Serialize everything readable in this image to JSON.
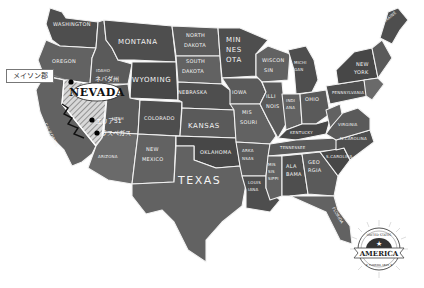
{
  "map": {
    "title": "United States of America",
    "style": "chalkboard",
    "highlight_state": "NEVADA",
    "highlight_state_jp": "ネバダ州",
    "colors": {
      "background": "#ffffff",
      "state_fill": "#5a5a5a",
      "state_border": "#f2f2f2",
      "label": "#f4f4f4",
      "nevada_fill": "#e8e8e8",
      "marker": "#000000"
    }
  },
  "states": [
    {
      "id": "WA",
      "label": "WASHINGTON"
    },
    {
      "id": "OR",
      "label": "OREGON"
    },
    {
      "id": "ID",
      "label": "IDAHO"
    },
    {
      "id": "MT",
      "label": "MONTANA"
    },
    {
      "id": "WY",
      "label": "WYOMING"
    },
    {
      "id": "CA",
      "label": "CALIFORNIA"
    },
    {
      "id": "NV",
      "label": "NEVADA"
    },
    {
      "id": "UT",
      "label": "UTAH"
    },
    {
      "id": "AZ",
      "label": "ARIZONA"
    },
    {
      "id": "CO",
      "label": "COLORADO"
    },
    {
      "id": "NM",
      "label": "NEW MEXICO"
    },
    {
      "id": "ND",
      "label": "NORTH DAKOTA"
    },
    {
      "id": "SD",
      "label": "SOUTH DAKOTA"
    },
    {
      "id": "NE",
      "label": "NEBRASKA"
    },
    {
      "id": "KS",
      "label": "KANSAS"
    },
    {
      "id": "OK",
      "label": "OKLAHOMA"
    },
    {
      "id": "TX",
      "label": "TEXAS"
    },
    {
      "id": "MN",
      "label": "MINNESOTA"
    },
    {
      "id": "IA",
      "label": "IOWA"
    },
    {
      "id": "MO",
      "label": "MISSOURI"
    },
    {
      "id": "AR",
      "label": "ARKANSAS"
    },
    {
      "id": "LA",
      "label": "LOUISIANA"
    },
    {
      "id": "WI",
      "label": "WISCONSIN"
    },
    {
      "id": "IL",
      "label": "ILLINOIS"
    },
    {
      "id": "MI",
      "label": "MICHIGAN"
    },
    {
      "id": "IN",
      "label": "INDIANA"
    },
    {
      "id": "OH",
      "label": "OHIO"
    },
    {
      "id": "KY",
      "label": "KENTUCKY"
    },
    {
      "id": "TN",
      "label": "TENNESSEE"
    },
    {
      "id": "MS",
      "label": "MISSISSIPPI"
    },
    {
      "id": "AL",
      "label": "ALABAMA"
    },
    {
      "id": "GA",
      "label": "GEORGIA"
    },
    {
      "id": "FL",
      "label": "FLORIDA"
    },
    {
      "id": "SC",
      "label": "SOUTH CAROLINA"
    },
    {
      "id": "NC",
      "label": "NORTH CAROLINA"
    },
    {
      "id": "VA",
      "label": "VIRGINIA"
    },
    {
      "id": "WV",
      "label": "WEST VIRGINIA"
    },
    {
      "id": "PA",
      "label": "PENNSYLVANIA"
    },
    {
      "id": "NY",
      "label": "NEW YORK"
    },
    {
      "id": "ME",
      "label": "MAINE"
    }
  ],
  "labels": {
    "WA": "WASHINGTON",
    "OR": "OREGON",
    "ID": "IDAHO",
    "MT": "MONTANA",
    "WY": "WYOMING",
    "CA": "CALIFORNIA",
    "NV": "NEVADA",
    "NV_jp": "ネバダ州",
    "UT": "UTAH",
    "AZ": "ARIZONA",
    "CO": "COLORADO",
    "NM1": "NEW",
    "NM2": "MEXICO",
    "ND1": "NORTH",
    "ND2": "DAKOTA",
    "SD1": "SOUTH",
    "SD2": "DAKOTA",
    "NE": "NEBRASKA",
    "KS": "KANSAS",
    "OK": "OKLAHOMA",
    "TX": "TEXAS",
    "MN1": "MIN",
    "MN2": "NES",
    "MN3": "OTA",
    "IA": "IOWA",
    "MO1": "MIS",
    "MO2": "SOURI",
    "AR1": "ARKA",
    "AR2": "NSAS",
    "LA1": "LOUIS",
    "LA2": "IANA",
    "WI1": "WISCON",
    "WI2": "SIN",
    "IL1": "ILLI",
    "IL2": "NOIS",
    "MI1": "MICHI",
    "MI2": "GAN",
    "IN1": "INDI",
    "IN2": "ANA",
    "OH": "OHIO",
    "KY": "KENTUCKY",
    "TN": "TENNESSEE",
    "MS1": "MIS",
    "MS2": "SIS",
    "MS3": "SIPPI",
    "AL1": "ALA",
    "AL2": "BAMA",
    "GA1": "GEO",
    "GA2": "RGIA",
    "FL": "FLORIDA",
    "SC": "S.CAROLINA",
    "NC": "N.CAROLINA",
    "VA": "VIRGINIA",
    "PA": "PENNSYLVANIA",
    "NY1": "NEW",
    "NY2": "YORK",
    "ME": "MAINE"
  },
  "markers": [
    {
      "name": "mason-county",
      "label": "メイソン郡"
    },
    {
      "name": "area-51",
      "label": "エリア51"
    },
    {
      "name": "las-vegas",
      "label": "ラスベガス"
    }
  ],
  "callout": {
    "label": "メイソン郡"
  },
  "badge": {
    "top_text": "UNITED STATES",
    "main_text": "AMERICA",
    "bottom_text": "★ FLORIDA 1845 ★"
  }
}
